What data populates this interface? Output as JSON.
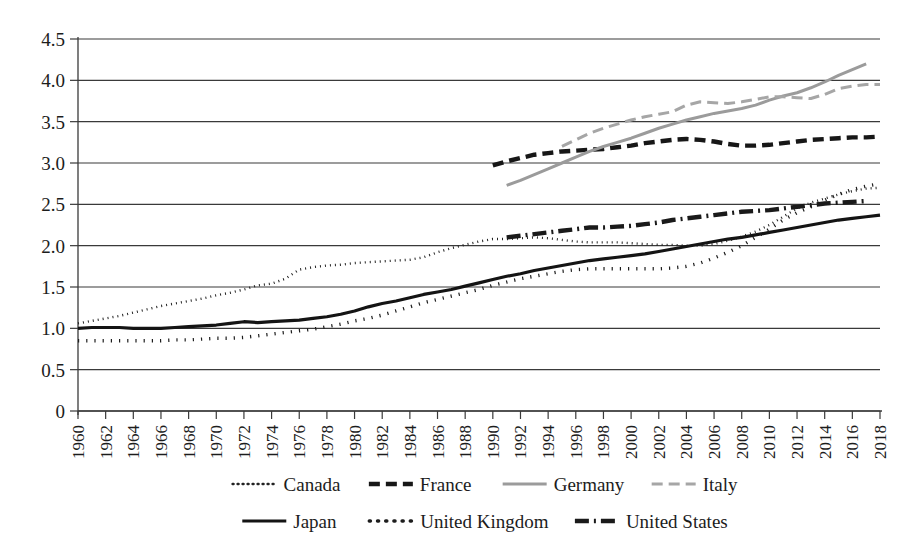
{
  "chart_data": {
    "type": "line",
    "title": "",
    "xlabel": "",
    "ylabel": "",
    "xlim": [
      1960,
      2018
    ],
    "ylim": [
      0,
      4.5
    ],
    "grid": true,
    "legend_position": "bottom",
    "y_ticks": [
      "0",
      "0.5",
      "1.0",
      "1.5",
      "2.0",
      "2.5",
      "3.0",
      "3.5",
      "4.0",
      "4.5"
    ],
    "y_tick_values": [
      0,
      0.5,
      1.0,
      1.5,
      2.0,
      2.5,
      3.0,
      3.5,
      4.0,
      4.5
    ],
    "x_ticks": [
      "1960",
      "1962",
      "1964",
      "1966",
      "1968",
      "1970",
      "1972",
      "1974",
      "1976",
      "1978",
      "1980",
      "1982",
      "1984",
      "1986",
      "1988",
      "1990",
      "1992",
      "1994",
      "1996",
      "1998",
      "2000",
      "2002",
      "2004",
      "2006",
      "2008",
      "2010",
      "2012",
      "2014",
      "2016",
      "2018"
    ],
    "x_tick_values": [
      1960,
      1962,
      1964,
      1966,
      1968,
      1970,
      1972,
      1974,
      1976,
      1978,
      1980,
      1982,
      1984,
      1986,
      1988,
      1990,
      1992,
      1994,
      1996,
      1998,
      2000,
      2002,
      2004,
      2006,
      2008,
      2010,
      2012,
      2014,
      2016,
      2018
    ],
    "series": [
      {
        "name": "Canada",
        "color": "#222222",
        "width": 2.4,
        "dash": "1,4",
        "x_start": 1960,
        "values": [
          1.06,
          1.09,
          1.12,
          1.15,
          1.19,
          1.23,
          1.27,
          1.3,
          1.33,
          1.36,
          1.4,
          1.43,
          1.47,
          1.52,
          1.54,
          1.6,
          1.71,
          1.74,
          1.76,
          1.77,
          1.79,
          1.8,
          1.81,
          1.82,
          1.83,
          1.86,
          1.92,
          1.97,
          2.01,
          2.05,
          2.08,
          2.08,
          2.09,
          2.1,
          2.09,
          2.07,
          2.05,
          2.04,
          2.04,
          2.04,
          2.03,
          2.02,
          2.01,
          2.01,
          2.0,
          2.0,
          2.02,
          2.06,
          2.11,
          2.17,
          2.25,
          2.35,
          2.45,
          2.52,
          2.57,
          2.62,
          2.66,
          2.69,
          2.7
        ]
      },
      {
        "name": "France",
        "color": "#171717",
        "width": 4.4,
        "dash": "11,6",
        "x_start": 1990,
        "values": [
          2.97,
          3.02,
          3.06,
          3.1,
          3.12,
          3.14,
          3.15,
          3.16,
          3.17,
          3.19,
          3.21,
          3.24,
          3.26,
          3.28,
          3.29,
          3.28,
          3.26,
          3.23,
          3.21,
          3.21,
          3.22,
          3.24,
          3.26,
          3.28,
          3.29,
          3.3,
          3.31,
          3.31,
          3.32
        ]
      },
      {
        "name": "Germany",
        "color": "#9b9b9b",
        "width": 3.0,
        "dash": "",
        "x_start": 1991,
        "values": [
          2.73,
          2.79,
          2.86,
          2.93,
          3.0,
          3.07,
          3.14,
          3.2,
          3.25,
          3.3,
          3.36,
          3.42,
          3.47,
          3.52,
          3.56,
          3.6,
          3.63,
          3.66,
          3.7,
          3.76,
          3.81,
          3.85,
          3.91,
          3.98,
          4.06,
          4.13,
          4.2
        ]
      },
      {
        "name": "Italy",
        "color": "#a6a6a6",
        "width": 3.0,
        "dash": "11,6",
        "x_start": 1995,
        "values": [
          3.2,
          3.28,
          3.36,
          3.42,
          3.47,
          3.52,
          3.56,
          3.59,
          3.62,
          3.7,
          3.74,
          3.73,
          3.72,
          3.74,
          3.77,
          3.8,
          3.8,
          3.79,
          3.78,
          3.83,
          3.9,
          3.93,
          3.95,
          3.95
        ]
      },
      {
        "name": "Japan",
        "color": "#141414",
        "width": 3.2,
        "dash": "",
        "x_start": 1960,
        "values": [
          1.0,
          1.01,
          1.01,
          1.01,
          1.0,
          1.0,
          1.0,
          1.01,
          1.02,
          1.03,
          1.04,
          1.06,
          1.08,
          1.07,
          1.08,
          1.09,
          1.1,
          1.12,
          1.14,
          1.17,
          1.21,
          1.26,
          1.3,
          1.33,
          1.37,
          1.41,
          1.44,
          1.47,
          1.51,
          1.55,
          1.59,
          1.63,
          1.66,
          1.7,
          1.73,
          1.76,
          1.79,
          1.82,
          1.84,
          1.86,
          1.88,
          1.9,
          1.93,
          1.96,
          1.99,
          2.02,
          2.05,
          2.08,
          2.1,
          2.13,
          2.16,
          2.19,
          2.22,
          2.25,
          2.28,
          2.31,
          2.33,
          2.35,
          2.37
        ]
      },
      {
        "name": "United Kingdom",
        "color": "#1d1d1d",
        "width": 3.4,
        "dash": "1.2,7",
        "x_start": 1960,
        "values": [
          0.85,
          0.85,
          0.85,
          0.85,
          0.85,
          0.85,
          0.85,
          0.86,
          0.86,
          0.87,
          0.88,
          0.88,
          0.89,
          0.91,
          0.93,
          0.95,
          0.97,
          0.99,
          1.02,
          1.05,
          1.09,
          1.12,
          1.16,
          1.21,
          1.26,
          1.31,
          1.35,
          1.39,
          1.43,
          1.47,
          1.52,
          1.56,
          1.6,
          1.63,
          1.66,
          1.69,
          1.71,
          1.72,
          1.72,
          1.72,
          1.72,
          1.72,
          1.72,
          1.73,
          1.75,
          1.79,
          1.85,
          1.92,
          2.0,
          2.1,
          2.2,
          2.31,
          2.4,
          2.47,
          2.55,
          2.62,
          2.68,
          2.72,
          2.75
        ]
      },
      {
        "name": "United States",
        "color": "#1a1a1a",
        "width": 4.4,
        "dash": "14,5,2,5",
        "x_start": 1991,
        "values": [
          2.1,
          2.12,
          2.14,
          2.16,
          2.18,
          2.2,
          2.22,
          2.22,
          2.23,
          2.24,
          2.26,
          2.28,
          2.31,
          2.33,
          2.35,
          2.37,
          2.39,
          2.41,
          2.42,
          2.43,
          2.45,
          2.47,
          2.49,
          2.51,
          2.52,
          2.53,
          2.54
        ]
      }
    ]
  },
  "legend": {
    "rows": [
      [
        {
          "label": "Canada",
          "key": "Canada"
        },
        {
          "label": "France",
          "key": "France"
        },
        {
          "label": "Germany",
          "key": "Germany"
        },
        {
          "label": "Italy",
          "key": "Italy"
        }
      ],
      [
        {
          "label": "Japan",
          "key": "Japan"
        },
        {
          "label": "United Kingdom",
          "key": "United Kingdom"
        },
        {
          "label": "United States",
          "key": "United States"
        }
      ]
    ]
  },
  "plot_geometry": {
    "left": 78,
    "right": 880,
    "top": 39,
    "bottom": 411
  }
}
